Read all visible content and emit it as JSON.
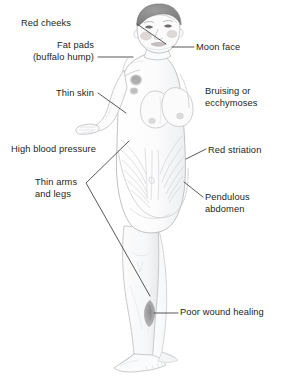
{
  "figure": {
    "background_color": "#ffffff",
    "text_color": "#231f20",
    "leader_line_color": "#3a3a3a",
    "skin_outline_color": "#b9babc",
    "skin_fill_color": "#fbfbfc",
    "hair_color": "#8a8a8a",
    "wound_color": "#9a9a9c",
    "bruise_color": "#a9a9ab"
  },
  "labels": [
    {
      "id": "red-cheeks",
      "text": "Red cheeks",
      "x": 71,
      "y": 18,
      "align": "right-align",
      "has_leader": true
    },
    {
      "id": "fat-pads-buffalo-hump",
      "text": "Fat pads\n(buffalo hump)",
      "x": 14,
      "y": 40,
      "align": "right-align",
      "has_leader": true
    },
    {
      "id": "moon-face",
      "text": "Moon face",
      "x": 196,
      "y": 42,
      "align": "left-align",
      "has_leader": true
    },
    {
      "id": "thin-skin",
      "text": "Thin skin",
      "x": 41,
      "y": 88,
      "align": "right-align",
      "has_leader": true
    },
    {
      "id": "bruising-or-ecchymoses",
      "text": "Bruising or\necchymoses",
      "x": 205,
      "y": 86,
      "align": "left-align",
      "has_leader": false
    },
    {
      "id": "high-blood-pressure",
      "text": "High blood pressure",
      "x": 11,
      "y": 144,
      "align": "left-align",
      "has_leader": false
    },
    {
      "id": "red-striation",
      "text": "Red striation",
      "x": 208,
      "y": 145,
      "align": "left-align",
      "has_leader": true
    },
    {
      "id": "thin-arms-and-legs",
      "text": "Thin arms\nand legs",
      "x": 35,
      "y": 177,
      "align": "left-align",
      "has_leader": true
    },
    {
      "id": "pendulous-abdomen",
      "text": "Pendulous\nabdomen",
      "x": 205,
      "y": 192,
      "align": "left-align",
      "has_leader": true
    },
    {
      "id": "poor-wound-healing",
      "text": "Poor wound healing",
      "x": 180,
      "y": 307,
      "align": "left-align",
      "has_leader": true
    }
  ],
  "leader_lines": [
    {
      "id": "leader-red-cheeks",
      "points": "137,24 166,44"
    },
    {
      "id": "leader-fat-pads",
      "points": "98,57 133,57"
    },
    {
      "id": "leader-moon-face",
      "points": "172,47 194,47"
    },
    {
      "id": "leader-thin-skin",
      "points": "98,93 126,113"
    },
    {
      "id": "leader-red-striation",
      "points": "186,159 206,149"
    },
    {
      "id": "leader-pendulous-abdomen",
      "points": "184,182 203,197"
    },
    {
      "id": "leader-thin-arms-upper",
      "points": "86,183 129,141"
    },
    {
      "id": "leader-thin-arms-lower",
      "points": "86,183 150,296"
    },
    {
      "id": "leader-poor-wound-healing",
      "points": "154,313 178,313"
    }
  ],
  "body_markers": [
    {
      "id": "bruise-upper-arm",
      "label": "ecchymosis-patch",
      "cx": 136,
      "cy": 83
    },
    {
      "id": "wound-shin",
      "label": "poorly-healing-wound",
      "cx": 150,
      "cy": 313
    }
  ]
}
